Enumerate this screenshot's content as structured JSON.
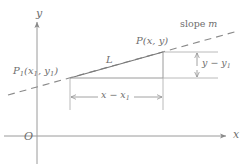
{
  "figure": {
    "background_color": "#ffffff",
    "stroke_color": "#8a8a8a",
    "text_color": "#6e6e6e"
  },
  "axes": {
    "y_label": "y",
    "x_label": "x",
    "origin_label": "O"
  },
  "labels": {
    "slope_prefix": "slope ",
    "slope_symbol": "m",
    "point_p": "P(x, y)",
    "point_p_name": "P",
    "point_p_coords": "(x, y)",
    "point_p1_name": "P",
    "point_p1_sub": "1",
    "point_p1_coords_x": "x",
    "point_p1_coords_x_sub": "1",
    "point_p1_coords_y": "y",
    "point_p1_coords_y_sub": "1",
    "line_name": "L",
    "rise_main": "y − y",
    "rise_sub": "1",
    "run_main": "x − x",
    "run_sub": "1"
  },
  "geometry": {
    "y_axis_x": 37,
    "x_axis_y": 136,
    "p1_x": 70,
    "p1_y": 78,
    "p_x": 163,
    "p_y": 52,
    "dashed_left_x": 8,
    "dashed_left_y": 95,
    "dashed_right_x": 238,
    "dashed_right_y": 31,
    "ext_right_x": 218,
    "dim_v_x": 197,
    "dim_h_y": 97
  }
}
